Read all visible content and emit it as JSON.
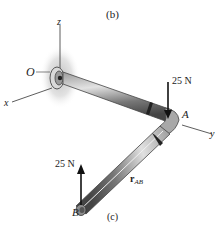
{
  "figure": {
    "caption_top": "(b)",
    "caption_bottom": "(c)"
  },
  "axes": {
    "z": "z",
    "x": "x",
    "y": "y",
    "origin": "O"
  },
  "points": {
    "A": "A",
    "B": "B"
  },
  "forces": {
    "at_A": "25 N",
    "at_B": "25 N"
  },
  "vector": {
    "symbol": "r",
    "subscript": "AB"
  },
  "colors": {
    "pipe_dark": "#555555",
    "pipe_light": "#bdbdbd",
    "support_glow": "#c8c8c8",
    "arrow": "#111111"
  }
}
